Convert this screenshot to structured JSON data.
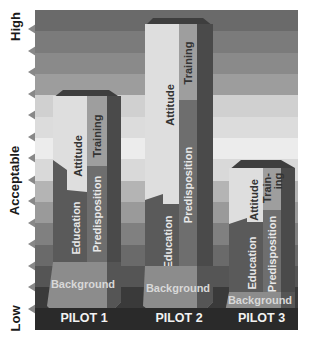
{
  "y_axis": {
    "high_label": "High",
    "acceptable_label": "Acceptable",
    "low_label": "Low",
    "tick_count": 14
  },
  "bands": [
    {
      "color": "#6a6a6a"
    },
    {
      "color": "#7b7b7b"
    },
    {
      "color": "#8a8a8a"
    },
    {
      "color": "#9d9d9d"
    },
    {
      "color": "#d0d0d0"
    },
    {
      "color": "#dcdcdc"
    },
    {
      "color": "#ececec"
    },
    {
      "color": "#d9d9d9"
    },
    {
      "color": "#b4b4b4"
    },
    {
      "color": "#9a9a9a"
    },
    {
      "color": "#808080"
    },
    {
      "color": "#6a6a6a"
    },
    {
      "color": "#555555"
    },
    {
      "color": "#3a3a3a"
    },
    {
      "color": "#303030"
    }
  ],
  "pilots": [
    {
      "label": "PILOT 1",
      "segments": {
        "background": "Background",
        "education": "Education",
        "predisposition": "Predisposition",
        "attitude": "Attitude",
        "training": "Training"
      }
    },
    {
      "label": "PILOT 2",
      "segments": {
        "background": "Background",
        "education": "Education",
        "predisposition": "Predisposition",
        "attitude": "Attitude",
        "training": "Training"
      }
    },
    {
      "label": "PILOT 3",
      "segments": {
        "background": "Background",
        "education": "Education",
        "predisposition": "Predisposition",
        "attitude": "Attitude",
        "training_line1": "Train-",
        "training_line2": "ing"
      }
    }
  ],
  "colors": {
    "attitude": "#dedede",
    "training": "#9e9e9e",
    "education": "#5a5a5a",
    "predisposition": "#6e6e6e",
    "background_seg": "#8c8c8c",
    "side_dark": "#4a4a4a",
    "top_cap": "#3e3e3e"
  }
}
